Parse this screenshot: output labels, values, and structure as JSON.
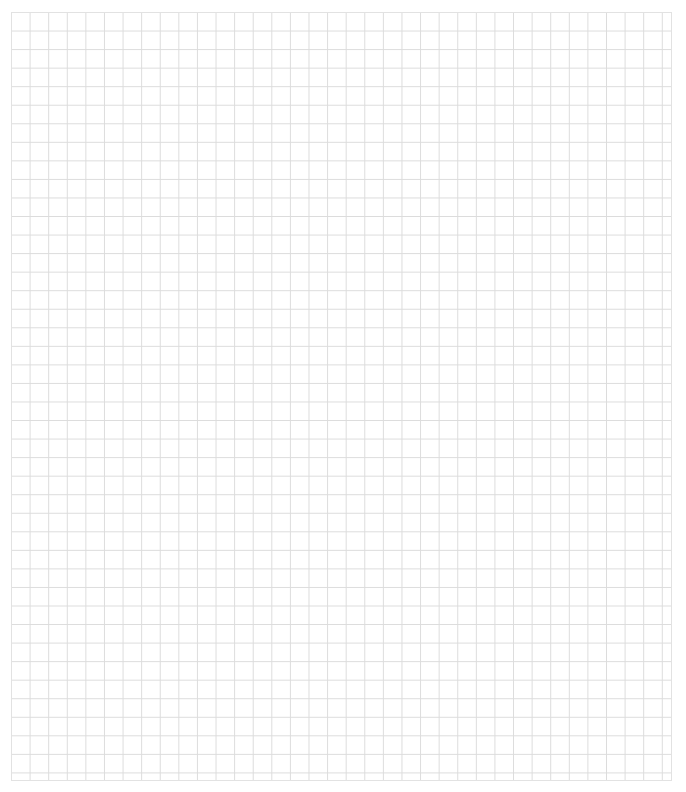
{
  "canvas": {
    "type": "blank-grid",
    "columns": 36,
    "rows": 41,
    "line_color": "#dcdcdc",
    "background_color": "#ffffff"
  }
}
